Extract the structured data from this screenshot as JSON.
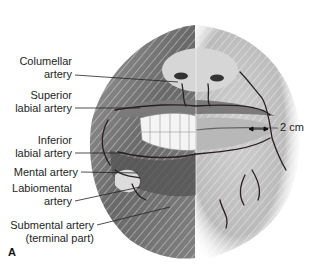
{
  "figure": {
    "panel_letter": "A",
    "scale_label": "2 cm",
    "labels": [
      {
        "id": "columellar",
        "line1": "Columellar",
        "line2": "artery"
      },
      {
        "id": "superior-labial",
        "line1": "Superior",
        "line2": "labial artery"
      },
      {
        "id": "inferior-labial",
        "line1": "Inferior",
        "line2": "labial artery"
      },
      {
        "id": "mental",
        "line1": "Mental artery",
        "line2": ""
      },
      {
        "id": "labiomental",
        "line1": "Labiomental",
        "line2": "artery"
      },
      {
        "id": "submental",
        "line1": "Submental artery",
        "line2": "(terminal part)"
      }
    ],
    "colors": {
      "artery": "#2a2020",
      "tissue_dark": "#5a5a5a",
      "tissue_light": "#c8c8c8",
      "background": "#ffffff"
    }
  }
}
